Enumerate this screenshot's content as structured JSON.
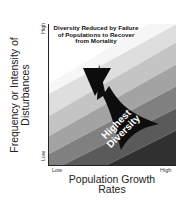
{
  "diagram": {
    "y_axis": {
      "label": "Frequency or Intensity of Disturbances",
      "tick_high": "High",
      "tick_low": "Low"
    },
    "x_axis": {
      "label_line1": "Population Growth",
      "label_line2": "Rates",
      "tick_low": "Low",
      "tick_high": "High"
    },
    "annotations": {
      "top_region": "Diversity Reduced by Failure of Populations to Recover from Mortality",
      "bottom_right_line1": "Highest",
      "bottom_right_line2": "Diversity"
    },
    "bands": {
      "colors": [
        "#f2f2f2",
        "#d9d9d9",
        "#bdbdbd",
        "#9a9a9a",
        "#7a7a7a",
        "#555555",
        "#333333"
      ]
    },
    "arrow_color": "#0d0d0d"
  }
}
